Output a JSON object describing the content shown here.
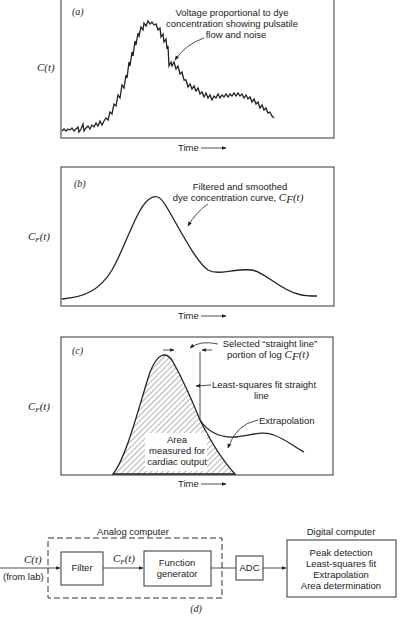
{
  "panels": {
    "a": {
      "label": "(a)",
      "ylabel": "C(t)",
      "xlabel": "Time",
      "annotation": [
        "Voltage proportional to dye",
        "concentration showing pulsatile",
        "flow and noise"
      ]
    },
    "b": {
      "label": "(b)",
      "ylabel_main": "C",
      "ylabel_sub": "F",
      "ylabel_tail": "(t)",
      "xlabel": "Time",
      "annotation_line1": "Filtered and smoothed",
      "annotation_line2": "dye concentration curve, ",
      "annotation_sym": "C",
      "annotation_sub": "F",
      "annotation_tail": "(t)"
    },
    "c": {
      "label": "(c)",
      "ylabel_main": "C",
      "ylabel_sub": "F",
      "ylabel_tail": "(t)",
      "xlabel": "Time",
      "selected_line1": "Selected “straight line”",
      "selected_line2": "portion of log ",
      "selected_sym": "C",
      "selected_sub": "F",
      "selected_tail": "(t)",
      "lsq_line1": "Least-squares fit straight",
      "lsq_line2": "line",
      "extrapolation": "Extrapolation",
      "area": [
        "Area",
        "measured for",
        "cardiac output"
      ]
    }
  },
  "block_diagram": {
    "label": "(d)",
    "input_signal": "C(t)",
    "input_source": "(from lab)",
    "analog_group": "Analog computer",
    "filter": "Filter",
    "mid_signal_main": "C",
    "mid_signal_sub": "F",
    "mid_signal_tail": "(t)",
    "function_generator": [
      "Function",
      "generator"
    ],
    "adc": "ADC",
    "digital_group": "Digital computer",
    "digital_steps": [
      "Peak detection",
      "Least-squares fit",
      "Extrapolation",
      "Area determination"
    ]
  }
}
